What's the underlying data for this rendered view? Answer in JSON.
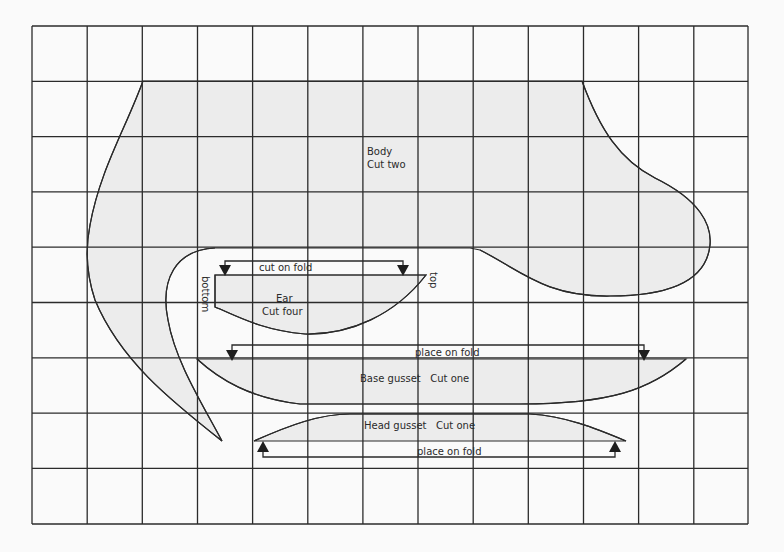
{
  "diagram": {
    "type": "sewing-pattern",
    "grid": {
      "columns": 13,
      "rows": 9,
      "origin_x": 32,
      "origin_y": 26,
      "cell_w": 55.15,
      "cell_h": 55.3
    },
    "colors": {
      "background": "#fafafa",
      "piece_fill": "#ececec",
      "line": "#2a2a2a"
    },
    "pieces": {
      "body": {
        "name": "Body",
        "instruction": "Cut two"
      },
      "ear": {
        "name": "Ear",
        "instruction": "Cut four",
        "label_left": "bottom",
        "label_right": "top",
        "fold_label": "cut on fold"
      },
      "base_gusset": {
        "label": "Base gusset   Cut one",
        "fold_label": "place on fold"
      },
      "head_gusset": {
        "label": "Head gusset   Cut one",
        "fold_label": "place on fold"
      }
    }
  }
}
